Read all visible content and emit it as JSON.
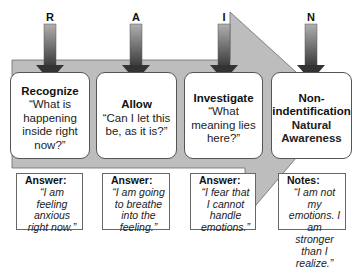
{
  "steps": [
    {
      "letter": "R",
      "title": "Recognize",
      "question": "“What is happening inside right now?”"
    },
    {
      "letter": "A",
      "title": "Allow",
      "question": "“Can I let this be, as it is?”"
    },
    {
      "letter": "I",
      "title": "Investigate",
      "question": "“What meaning lies here?”"
    },
    {
      "letter": "N",
      "title": "Non-indentification",
      "question": "Natural Awareness"
    }
  ],
  "answers": [
    {
      "label": "Answer:",
      "text": "“I am feeling anxious right now.”"
    },
    {
      "label": "Answer:",
      "text": "“I am going to breathe into the feeling.”"
    },
    {
      "label": "Answer:",
      "text": "“I fear that I cannot handle emotions.”"
    },
    {
      "label": "Notes:",
      "text": "“I am not my emotions. I am stronger than I realize.”"
    }
  ],
  "colors": {
    "band": "#b9b9b9",
    "arrow_top": "#a8a8a8",
    "arrow_bottom": "#2e2e2e"
  }
}
